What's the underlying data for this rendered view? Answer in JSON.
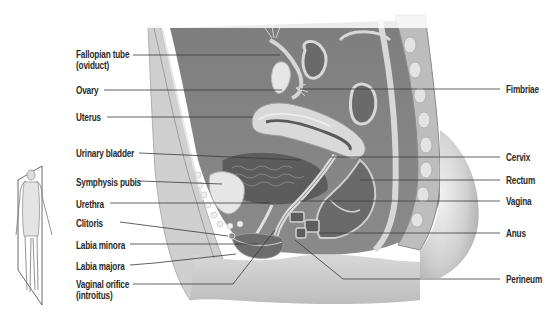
{
  "figure": {
    "labels_left": [
      {
        "id": "fallopian-tube",
        "text": "Fallopian tube",
        "text2": "(oviduct)",
        "x": 76,
        "y": 49,
        "line": [
          [
            133,
            55
          ],
          [
            280,
            55
          ]
        ]
      },
      {
        "id": "ovary",
        "text": "Ovary",
        "x": 76,
        "y": 85,
        "line": [
          [
            104,
            90
          ],
          [
            282,
            90
          ]
        ]
      },
      {
        "id": "uterus",
        "text": "Uterus",
        "x": 76,
        "y": 112,
        "line": [
          [
            107,
            117
          ],
          [
            253,
            117
          ]
        ]
      },
      {
        "id": "urinary-bladder",
        "text": "Urinary bladder",
        "x": 76,
        "y": 148,
        "line": [
          [
            139,
            153
          ],
          [
            300,
            160
          ]
        ]
      },
      {
        "id": "symphysis-pubis",
        "text": "Symphysis pubis",
        "x": 76,
        "y": 177,
        "line": [
          [
            139,
            181
          ],
          [
            222,
            184
          ]
        ]
      },
      {
        "id": "urethra",
        "text": "Urethra",
        "x": 76,
        "y": 199,
        "line": [
          [
            110,
            203
          ],
          [
            270,
            203
          ]
        ]
      },
      {
        "id": "clitoris",
        "text": "Clitoris",
        "x": 76,
        "y": 219,
        "line": [
          [
            120,
            222
          ],
          [
            228,
            236
          ]
        ]
      },
      {
        "id": "labia-minora",
        "text": "Labia minora",
        "x": 76,
        "y": 240,
        "line": [
          [
            130,
            244
          ],
          [
            258,
            244
          ]
        ]
      },
      {
        "id": "labia-majora",
        "text": "Labia majora",
        "x": 76,
        "y": 261,
        "line": [
          [
            130,
            265
          ],
          [
            155,
            263
          ],
          [
            236,
            254
          ]
        ]
      },
      {
        "id": "vaginal-orifice",
        "text": "Vaginal orifice",
        "text2": "(introitus)",
        "x": 76,
        "y": 279,
        "line": [
          [
            133,
            284
          ],
          [
            233,
            284
          ],
          [
            275,
            230
          ]
        ]
      }
    ],
    "labels_right": [
      {
        "id": "fimbriae",
        "text": "Fimbriae",
        "x": 508,
        "y": 84,
        "line": [
          [
            300,
            89
          ],
          [
            500,
            89
          ]
        ]
      },
      {
        "id": "cervix",
        "text": "Cervix",
        "x": 507,
        "y": 152,
        "line": [
          [
            330,
            157
          ],
          [
            500,
            157
          ]
        ]
      },
      {
        "id": "rectum",
        "text": "Rectum",
        "x": 507,
        "y": 175,
        "line": [
          [
            360,
            180
          ],
          [
            500,
            180
          ]
        ]
      },
      {
        "id": "vagina",
        "text": "Vagina",
        "x": 507,
        "y": 196,
        "line": [
          [
            300,
            201
          ],
          [
            500,
            201
          ]
        ]
      },
      {
        "id": "anus",
        "text": "Anus",
        "x": 507,
        "y": 229,
        "line": [
          [
            320,
            233
          ],
          [
            500,
            233
          ]
        ]
      },
      {
        "id": "perineum",
        "text": "Perineum",
        "x": 507,
        "y": 273,
        "line": [
          [
            295,
            240
          ],
          [
            343,
            279
          ],
          [
            500,
            279
          ]
        ]
      }
    ],
    "colors": {
      "line": "#3a3a3a",
      "text": "#2a2a2a",
      "tissue_dark": "#6e6e6e",
      "tissue_mid": "#a4a4a4",
      "tissue_light": "#d2d2d2",
      "skin": "#c8c8c8"
    },
    "inset": {
      "description": "standing female figure with midsagittal plane"
    }
  }
}
